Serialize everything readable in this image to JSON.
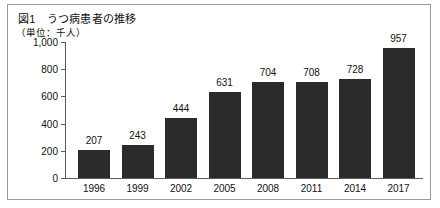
{
  "figure": {
    "title": "図1　うつ病患者の推移",
    "unit_label": "（単位：千人）"
  },
  "chart_data": {
    "type": "bar",
    "title": "図1　うつ病患者の推移",
    "subtitle": "（単位：千人）",
    "xlabel": "",
    "ylabel": "千人",
    "categories": [
      "1996",
      "1999",
      "2002",
      "2005",
      "2008",
      "2011",
      "2014",
      "2017"
    ],
    "values": [
      207,
      243,
      444,
      631,
      704,
      708,
      728,
      957
    ],
    "value_labels": [
      "207",
      "243",
      "444",
      "631",
      "704",
      "708",
      "728",
      "957"
    ],
    "ylim": [
      0,
      1000
    ],
    "yticks": [
      0,
      200,
      400,
      600,
      800,
      1000
    ],
    "ytick_labels": [
      "0",
      "200",
      "400",
      "600",
      "800",
      "1,000"
    ],
    "grid": false,
    "legend": null,
    "bar_color": "#2b2b2b",
    "axis_color": "#5a5a5a",
    "border_color": "#9a9a9a",
    "background_color": "#ffffff"
  }
}
